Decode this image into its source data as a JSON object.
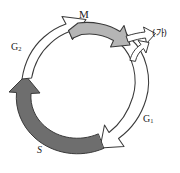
{
  "diagram": {
    "type": "cycle",
    "background_color": "#ffffff",
    "outline_color": "#3a3a3a",
    "phases": [
      {
        "id": "m",
        "label": "M",
        "position": "top",
        "fill_color": "#b5b5b5",
        "style": "filled-light-gray",
        "direction": "clockwise"
      },
      {
        "id": "g2",
        "label": "G",
        "subscript": "2",
        "position": "left",
        "fill_color": "#ffffff",
        "style": "outlined-white",
        "direction": "clockwise"
      },
      {
        "id": "s",
        "label": "S",
        "position": "bottom-left",
        "fill_color": "#6e6e6e",
        "style": "filled-dark-gray",
        "direction": "clockwise"
      },
      {
        "id": "g1",
        "label": "G",
        "subscript": "1",
        "position": "right",
        "fill_color": "#ffffff",
        "style": "outlined-white",
        "direction": "clockwise"
      }
    ],
    "branch": {
      "id": "branch-ga",
      "label": "(가)",
      "position": "upper-right",
      "fill_color": "#ffffff",
      "style": "outlined-white",
      "description": "exit branch arrow from M phase"
    }
  }
}
